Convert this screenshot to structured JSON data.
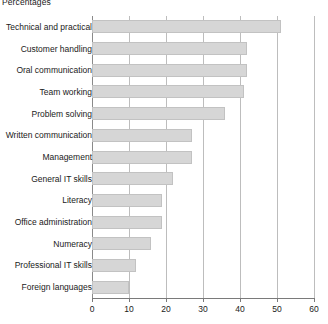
{
  "chart": {
    "title": "Percentages"
  },
  "chart_data": {
    "type": "bar",
    "orientation": "horizontal",
    "title": "Percentages",
    "xlabel": "",
    "ylabel": "",
    "xlim": [
      0,
      60
    ],
    "xticks": [
      0,
      10,
      20,
      30,
      40,
      50,
      60
    ],
    "xtick_labels": [
      "0",
      "10",
      "20",
      "30",
      "40",
      "50",
      "60"
    ],
    "grid": true,
    "legend": false,
    "bar_color": "#d6d6d6",
    "bar_border_color": "#c2c2c2",
    "categories": [
      "Technical and practical",
      "Customer handling",
      "Oral communication",
      "Team working",
      "Problem solving",
      "Written communication",
      "Management",
      "General IT skills",
      "Literacy",
      "Office administration",
      "Numeracy",
      "Professional IT skills",
      "Foreign languages"
    ],
    "values": [
      51,
      42,
      42,
      41,
      36,
      27,
      27,
      22,
      19,
      19,
      16,
      12,
      10
    ]
  }
}
